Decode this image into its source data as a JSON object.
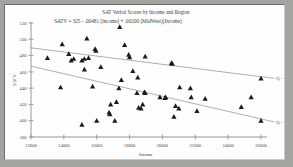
{
  "window": {
    "background_color": "#a3a39f",
    "plot_background_color": "#fefefe",
    "border_color": "#6e6e6e"
  },
  "chart_data": {
    "type": "scatter",
    "title": "SAT Verbal Scores by Income and Region",
    "annotation": "SATV = 325 - .00481 (Income) + .00200 (MidWest)(Income)",
    "xlabel": "Income",
    "ylabel": "SATV",
    "xlim": [
      12000,
      26000
    ],
    "ylim": [
      380,
      520
    ],
    "xticks": [
      12000,
      14000,
      16000,
      18000,
      20000,
      22000,
      24000,
      26000
    ],
    "xtick_labels": [
      "12000",
      "14000",
      "16000",
      "18000",
      "20000",
      "22000",
      "24000",
      "26000"
    ],
    "yticks": [
      380,
      400,
      420,
      440,
      460,
      480,
      500,
      520
    ],
    "ytick_labels": [
      "380",
      "400",
      "420",
      "440",
      "460",
      "480",
      "500",
      "520"
    ],
    "grid": false,
    "legend_position": "right",
    "marker_style": "triangle",
    "marker_color": "#1b1b1b",
    "line_color": "#9b9b9b",
    "series": [
      {
        "name": "Q = 1",
        "label": "Q = 1",
        "line": {
          "x": [
            12000,
            26800
          ],
          "y": [
            489.5,
            452.0
          ]
        },
        "points": [
          {
            "x": 13000,
            "y": 477
          },
          {
            "x": 13900,
            "y": 494
          },
          {
            "x": 14300,
            "y": 482
          },
          {
            "x": 14450,
            "y": 474
          },
          {
            "x": 14600,
            "y": 476
          },
          {
            "x": 15100,
            "y": 474
          },
          {
            "x": 15250,
            "y": 476
          },
          {
            "x": 15400,
            "y": 501
          },
          {
            "x": 15500,
            "y": 477
          },
          {
            "x": 15250,
            "y": 463
          },
          {
            "x": 15900,
            "y": 488
          },
          {
            "x": 15950,
            "y": 486
          },
          {
            "x": 16250,
            "y": 466
          },
          {
            "x": 17400,
            "y": 515
          },
          {
            "x": 17700,
            "y": 493
          },
          {
            "x": 17950,
            "y": 481
          },
          {
            "x": 18000,
            "y": 478
          },
          {
            "x": 18950,
            "y": 479
          },
          {
            "x": 20600,
            "y": 470
          },
          {
            "x": 20550,
            "y": 471
          },
          {
            "x": 26000,
            "y": 452
          }
        ]
      },
      {
        "name": "Q = 0",
        "label": "Q = 0",
        "line": {
          "x": [
            12000,
            26800
          ],
          "y": [
            467.0,
            398.5
          ]
        },
        "points": [
          {
            "x": 13800,
            "y": 441
          },
          {
            "x": 15100,
            "y": 395
          },
          {
            "x": 15750,
            "y": 442
          },
          {
            "x": 16000,
            "y": 400
          },
          {
            "x": 16750,
            "y": 410
          },
          {
            "x": 16800,
            "y": 408
          },
          {
            "x": 16850,
            "y": 420
          },
          {
            "x": 17100,
            "y": 400
          },
          {
            "x": 17200,
            "y": 423
          },
          {
            "x": 17350,
            "y": 440
          },
          {
            "x": 17500,
            "y": 450
          },
          {
            "x": 18200,
            "y": 461
          },
          {
            "x": 18450,
            "y": 434
          },
          {
            "x": 18500,
            "y": 453
          },
          {
            "x": 18550,
            "y": 416
          },
          {
            "x": 18700,
            "y": 415
          },
          {
            "x": 18800,
            "y": 420
          },
          {
            "x": 18900,
            "y": 435
          },
          {
            "x": 18950,
            "y": 434
          },
          {
            "x": 19850,
            "y": 429
          },
          {
            "x": 20150,
            "y": 428
          },
          {
            "x": 20200,
            "y": 429
          },
          {
            "x": 20700,
            "y": 405
          },
          {
            "x": 20800,
            "y": 418
          },
          {
            "x": 21000,
            "y": 415
          },
          {
            "x": 21050,
            "y": 441
          },
          {
            "x": 21700,
            "y": 440
          },
          {
            "x": 21750,
            "y": 429
          },
          {
            "x": 22100,
            "y": 412
          },
          {
            "x": 22600,
            "y": 427
          },
          {
            "x": 24800,
            "y": 417
          },
          {
            "x": 25400,
            "y": 429
          },
          {
            "x": 26000,
            "y": 400
          }
        ]
      }
    ]
  }
}
